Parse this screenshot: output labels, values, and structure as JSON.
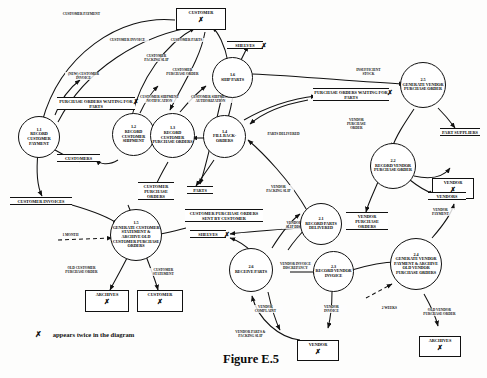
{
  "figure": {
    "caption": "Figure E.5",
    "legend_symbol": "✗",
    "legend_text": "appears twice in the diagram"
  },
  "diagram": {
    "type": "data-flow-diagram",
    "processes": [
      {
        "id": "1.1",
        "number": "1.1",
        "label": "RECORD CUSTOMER PAYMENT",
        "lines": [
          "RECORD",
          "CUSTOMER",
          "PAYMENT"
        ]
      },
      {
        "id": "1.2",
        "number": "1.2",
        "label": "RECORD CUSTOMER SHIPMENT",
        "lines": [
          "RECORD",
          "CUSTOMER",
          "SHIPMENT"
        ]
      },
      {
        "id": "1.3",
        "number": "1.3",
        "label": "RECORD CUSTOMER PURCHASE ORDERS",
        "lines": [
          "RECORD",
          "CUSTOMER",
          "PURCHASE",
          "ORDERS"
        ]
      },
      {
        "id": "1.4",
        "number": "1.4",
        "label": "FILL BACK-ORDERS",
        "lines": [
          "FILL",
          "BACK-",
          "ORDERS"
        ]
      },
      {
        "id": "1.5",
        "number": "1.5",
        "label": "GENERATE CUSTOMER STATEMENT & ARCHIVE OLD CUSTOMER PURCHASE ORDERS",
        "lines": [
          "GENERATE",
          "CUSTOMER STATE-",
          "MENT & ARCHIVE",
          "OLD CUSTOMER",
          "PURCHASE",
          "ORDERS"
        ]
      },
      {
        "id": "1.6",
        "number": "1.6",
        "label": "SHIP PARTS",
        "lines": [
          "SHIP",
          "PARTS"
        ]
      },
      {
        "id": "2.1",
        "number": "2.1",
        "label": "RECORD PARTS DELIVERED",
        "lines": [
          "RECORD",
          "PARTS",
          "DELIVERED"
        ]
      },
      {
        "id": "2.2",
        "number": "2.2",
        "label": "RECORD VENDOR PURCHASE ORDER",
        "lines": [
          "RECORD",
          "VENDOR",
          "PURCHASE",
          "ORDER"
        ]
      },
      {
        "id": "2.3",
        "number": "2.3",
        "label": "RECORD VENDOR INVOICE",
        "lines": [
          "RECORD",
          "VENDOR",
          "INVOICE"
        ]
      },
      {
        "id": "2.4",
        "number": "2.4",
        "label": "GENERATE VENDOR PAYMENT & ARCHIVE OLD VENDOR PURCHASE ORDERS",
        "lines": [
          "GENERATE",
          "VENDOR PAY-",
          "MENT & ARCHIVE",
          "OLD VENDOR",
          "PURCHASE",
          "ORDERS"
        ]
      },
      {
        "id": "2.5",
        "number": "2.5",
        "label": "GENERATE VENDOR PURCHASE ORDER",
        "lines": [
          "GENERATE",
          "VENDOR",
          "PURCHASE",
          "ORDER"
        ]
      },
      {
        "id": "2.6",
        "number": "2.6",
        "label": "RECEIVE PARTS",
        "lines": [
          "RECEIVE",
          "PARTS"
        ]
      }
    ],
    "entities": [
      {
        "id": "customer-top",
        "label": "CUSTOMER",
        "duplicate": true,
        "mark": "✗"
      },
      {
        "id": "archives-left",
        "label": "ARCHIVES",
        "duplicate": true,
        "mark": "✗"
      },
      {
        "id": "customer-bottom-left",
        "label": "CUSTOMER",
        "duplicate": true,
        "mark": "✗"
      },
      {
        "id": "vendor-right",
        "label": "VENDOR",
        "duplicate": true,
        "mark": "✗"
      },
      {
        "id": "vendor-bottom",
        "label": "VENDOR",
        "duplicate": true,
        "mark": "✗"
      },
      {
        "id": "archives-right",
        "label": "ARCHIVES",
        "duplicate": true,
        "mark": "✗"
      }
    ],
    "stores": [
      {
        "id": "shelves-top",
        "label": "SHELVES",
        "duplicate": true,
        "mark": "✗"
      },
      {
        "id": "po-waiting-left",
        "label": "PURCHASE ORDERS WAITING FOR PARTS",
        "duplicate": true,
        "mark": "✗"
      },
      {
        "id": "po-waiting-right",
        "label": "PURCHASE ORDERS WAITING FOR PARTS",
        "duplicate": true,
        "mark": "✗"
      },
      {
        "id": "customers",
        "label": "CUSTOMERS",
        "duplicate": false,
        "mark": ""
      },
      {
        "id": "customer-purchase-orders",
        "label": "CUSTOMER PURCHASE ORDERS",
        "duplicate": false,
        "mark": ""
      },
      {
        "id": "parts",
        "label": "PARTS",
        "duplicate": false,
        "mark": ""
      },
      {
        "id": "customer-invoices",
        "label": "CUSTOMER INVOICES",
        "duplicate": false,
        "mark": ""
      },
      {
        "id": "cpo-sent-by-customer",
        "label": "CUSTOMER PURCHASE ORDERS SENT BY CUSTOMER",
        "duplicate": false,
        "mark": ""
      },
      {
        "id": "shelves-mid",
        "label": "SHELVES",
        "duplicate": true,
        "mark": "✗"
      },
      {
        "id": "part-suppliers",
        "label": "PART SUPPLIERS",
        "duplicate": false,
        "mark": ""
      },
      {
        "id": "vendors",
        "label": "VENDORS",
        "duplicate": false,
        "mark": ""
      },
      {
        "id": "vendor-purchase-orders",
        "label": "VENDOR PURCHASE ORDERS",
        "duplicate": false,
        "mark": ""
      }
    ],
    "flows": [
      {
        "id": "customer-payment",
        "label": "CUSTOMER PAYMENT"
      },
      {
        "id": "customer-invoice",
        "label": "CUSTOMER INVOICE"
      },
      {
        "id": "customer-parts",
        "label": "CUSTOMER PARTS"
      },
      {
        "id": "customer-packing-slip",
        "label": "CUSTOMER PACKING SLIP"
      },
      {
        "id": "customer-purchase-order",
        "label": "CUSTOMER PURCHASE ORDER"
      },
      {
        "id": "new-customer-invoice",
        "label": "(NEW) CUSTOMER INVOICE"
      },
      {
        "id": "customer-shipment-notification",
        "label": "CUSTOMER SHIPMENT NOTIFICATION"
      },
      {
        "id": "customer-shipment-authorization",
        "label": "CUSTOMER SHIPMENT AUTHORIZATION"
      },
      {
        "id": "insufficient-stock",
        "label": "INSUFFICIENT STOCK"
      },
      {
        "id": "parts-delivered",
        "label": "PARTS DELIVERED"
      },
      {
        "id": "vendor-purchase-order",
        "label": "VENDOR PURCHASE ORDER"
      },
      {
        "id": "vendor-packing-slip",
        "label": "VENDOR PACKING SLIP"
      },
      {
        "id": "vendor-packing-slip-discrepancy",
        "label": "VENDOR PACKING SLIP DISCREPANCY"
      },
      {
        "id": "vendor-invoice-discrepancy",
        "label": "VENDOR INVOICE DISCREPANCY"
      },
      {
        "id": "vendor-complaint",
        "label": "VENDOR COMPLAINT"
      },
      {
        "id": "vendor-invoice",
        "label": "VENDOR INVOICE"
      },
      {
        "id": "vendor-parts-packing-slip",
        "label": "VENDOR PARTS & PACKING SLIP"
      },
      {
        "id": "vendor-payment",
        "label": "VENDOR PAYMENT"
      },
      {
        "id": "old-vendor-purchase-order",
        "label": "OLD VENDOR PURCHASE ORDER"
      },
      {
        "id": "old-customer-purchase-order",
        "label": "OLD CUSTOMER PURCHASE ORDER"
      },
      {
        "id": "customer-statement",
        "label": "CUSTOMER STATEMENT"
      },
      {
        "id": "one-month",
        "label": "1 MONTH"
      },
      {
        "id": "two-weeks",
        "label": "2 WEEKS"
      }
    ]
  }
}
